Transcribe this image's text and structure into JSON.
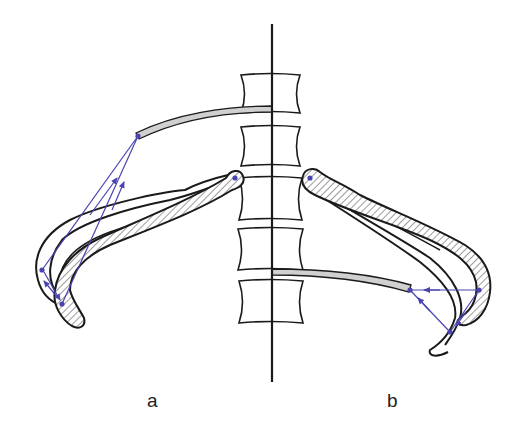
{
  "figure": {
    "panels": [
      {
        "id": "a",
        "label": "a",
        "description": "Left side: rib and cartilage elevated, lever arrows pointing upward to costal attachment"
      },
      {
        "id": "b",
        "label": "b",
        "description": "Right side: rib depressed, lever arrows pointing toward lower costal attachment"
      }
    ],
    "colors": {
      "outline": "#1a1a1a",
      "hatch": "#555555",
      "cartilage_fill": "#d0d0d0",
      "vector": "#4a44b0",
      "background": "#ffffff"
    },
    "elements": {
      "midline": "vertical midline axis",
      "vertebrae_count": 5,
      "vertebrae": "stacked vertebral bodies",
      "rib_a": "hatched rib with outlined alternate rib positions (left)",
      "rib_b": "hatched rib with outlined alternate rib positions (right)",
      "cartilage_a": "grey costal cartilage strip (upper, left)",
      "cartilage_b": "grey costal cartilage strip (lower, right)",
      "vectors": "blue force/motion vector triangles with arrowheads"
    }
  }
}
